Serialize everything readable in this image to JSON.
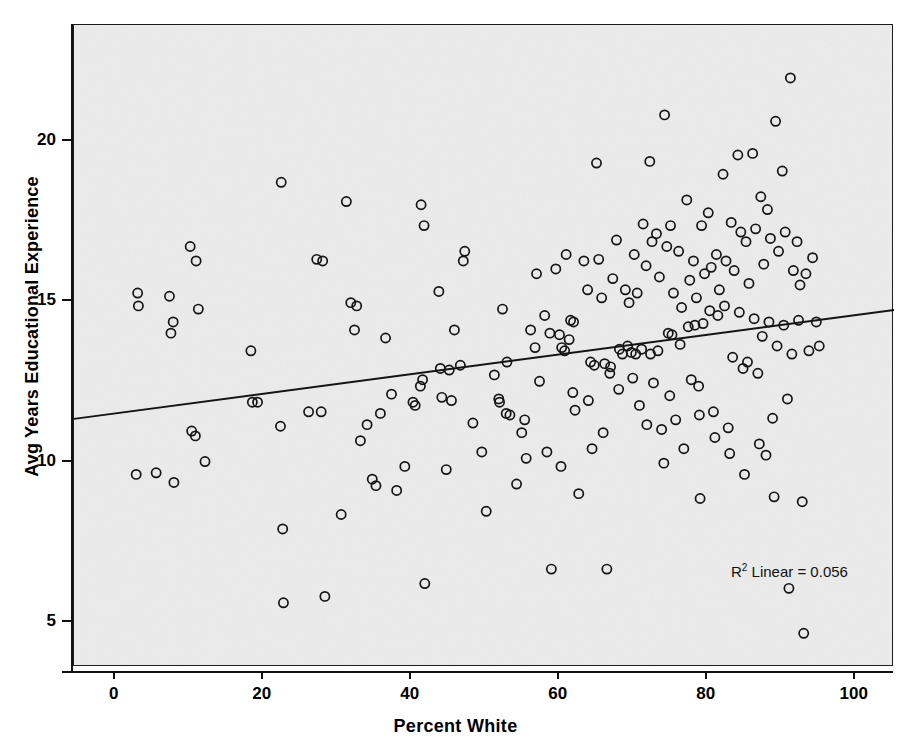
{
  "chart_data": {
    "type": "scatter",
    "title": "",
    "xlabel": "Percent White",
    "ylabel": "Avg Years Educational Experience",
    "xlim": [
      -5.5,
      105.3
    ],
    "ylim": [
      3.6,
      23.6
    ],
    "xticks": [
      0,
      20,
      40,
      60,
      80,
      100
    ],
    "yticks": [
      5,
      10,
      15,
      20
    ],
    "grid": false,
    "legend": null,
    "annotation": "R² Linear = 0.056",
    "annotation_r2_prefix": "R",
    "annotation_r2_exp": "2",
    "annotation_r2_text": " Linear = 0.056",
    "marker_style": "open-circle",
    "fit_line": {
      "type": "linear",
      "r_squared": 0.056,
      "x_start": -5.5,
      "y_start": 11.33,
      "x_end": 105.3,
      "y_end": 14.72
    },
    "points": [
      [
        3.1,
        15.25
      ],
      [
        3.2,
        14.85
      ],
      [
        2.9,
        9.6
      ],
      [
        5.6,
        9.65
      ],
      [
        7.4,
        15.15
      ],
      [
        7.9,
        14.35
      ],
      [
        7.6,
        14.0
      ],
      [
        8.0,
        9.35
      ],
      [
        10.2,
        16.7
      ],
      [
        11.0,
        16.25
      ],
      [
        11.3,
        14.75
      ],
      [
        10.4,
        10.95
      ],
      [
        10.9,
        10.8
      ],
      [
        12.2,
        10.0
      ],
      [
        18.4,
        13.45
      ],
      [
        18.6,
        11.85
      ],
      [
        19.3,
        11.85
      ],
      [
        22.5,
        18.7
      ],
      [
        22.4,
        11.1
      ],
      [
        22.7,
        7.9
      ],
      [
        22.8,
        5.6
      ],
      [
        26.2,
        11.55
      ],
      [
        27.3,
        16.3
      ],
      [
        28.1,
        16.25
      ],
      [
        27.9,
        11.55
      ],
      [
        28.4,
        5.8
      ],
      [
        30.6,
        8.35
      ],
      [
        31.3,
        18.1
      ],
      [
        31.9,
        14.95
      ],
      [
        32.7,
        14.85
      ],
      [
        32.4,
        14.1
      ],
      [
        33.2,
        10.65
      ],
      [
        34.1,
        11.15
      ],
      [
        34.8,
        9.45
      ],
      [
        35.3,
        9.25
      ],
      [
        35.9,
        11.5
      ],
      [
        36.6,
        13.85
      ],
      [
        37.4,
        12.1
      ],
      [
        38.1,
        9.1
      ],
      [
        39.2,
        9.85
      ],
      [
        40.3,
        11.85
      ],
      [
        40.6,
        11.75
      ],
      [
        41.4,
        18.0
      ],
      [
        41.8,
        17.35
      ],
      [
        41.6,
        12.55
      ],
      [
        41.3,
        12.35
      ],
      [
        41.9,
        6.2
      ],
      [
        43.8,
        15.3
      ],
      [
        44.2,
        12.0
      ],
      [
        44.8,
        9.75
      ],
      [
        45.5,
        11.9
      ],
      [
        45.9,
        14.1
      ],
      [
        46.7,
        13.0
      ],
      [
        47.3,
        16.55
      ],
      [
        47.1,
        16.25
      ],
      [
        48.4,
        11.2
      ],
      [
        49.6,
        10.3
      ],
      [
        50.2,
        8.45
      ],
      [
        51.3,
        12.7
      ],
      [
        51.9,
        11.95
      ],
      [
        52.0,
        11.85
      ],
      [
        52.4,
        14.75
      ],
      [
        52.9,
        11.5
      ],
      [
        53.4,
        11.45
      ],
      [
        54.3,
        9.3
      ],
      [
        55.0,
        10.9
      ],
      [
        55.6,
        10.1
      ],
      [
        56.2,
        14.1
      ],
      [
        56.8,
        13.55
      ],
      [
        57.4,
        12.5
      ],
      [
        58.1,
        14.55
      ],
      [
        58.8,
        14.0
      ],
      [
        58.4,
        10.3
      ],
      [
        59.0,
        6.65
      ],
      [
        59.6,
        16.0
      ],
      [
        60.1,
        13.95
      ],
      [
        60.4,
        13.55
      ],
      [
        60.8,
        13.45
      ],
      [
        60.3,
        9.85
      ],
      [
        61.0,
        16.45
      ],
      [
        61.6,
        14.4
      ],
      [
        61.4,
        13.8
      ],
      [
        61.9,
        12.15
      ],
      [
        62.2,
        11.6
      ],
      [
        62.7,
        9.0
      ],
      [
        63.4,
        16.25
      ],
      [
        63.9,
        15.35
      ],
      [
        64.3,
        13.1
      ],
      [
        64.8,
        13.0
      ],
      [
        64.5,
        10.4
      ],
      [
        65.1,
        19.3
      ],
      [
        65.4,
        16.3
      ],
      [
        65.8,
        15.1
      ],
      [
        66.2,
        13.05
      ],
      [
        66.9,
        12.75
      ],
      [
        66.5,
        6.65
      ],
      [
        67.3,
        15.7
      ],
      [
        67.8,
        16.9
      ],
      [
        68.2,
        13.5
      ],
      [
        68.6,
        13.35
      ],
      [
        68.1,
        12.25
      ],
      [
        69.0,
        15.35
      ],
      [
        69.5,
        14.95
      ],
      [
        69.3,
        13.6
      ],
      [
        69.8,
        13.4
      ],
      [
        70.2,
        16.45
      ],
      [
        70.6,
        15.25
      ],
      [
        70.4,
        13.35
      ],
      [
        70.9,
        11.75
      ],
      [
        71.4,
        17.4
      ],
      [
        71.8,
        16.1
      ],
      [
        71.2,
        13.5
      ],
      [
        71.9,
        11.15
      ],
      [
        72.3,
        19.35
      ],
      [
        72.6,
        16.85
      ],
      [
        72.4,
        13.35
      ],
      [
        72.8,
        12.45
      ],
      [
        73.2,
        17.1
      ],
      [
        73.6,
        15.75
      ],
      [
        73.4,
        13.45
      ],
      [
        73.9,
        11.0
      ],
      [
        74.3,
        20.8
      ],
      [
        74.6,
        16.7
      ],
      [
        74.8,
        14.0
      ],
      [
        74.2,
        9.95
      ],
      [
        75.1,
        17.35
      ],
      [
        75.5,
        15.25
      ],
      [
        75.3,
        13.95
      ],
      [
        75.8,
        11.3
      ],
      [
        76.2,
        16.55
      ],
      [
        76.6,
        14.8
      ],
      [
        76.4,
        13.65
      ],
      [
        76.9,
        10.4
      ],
      [
        77.3,
        18.15
      ],
      [
        77.7,
        15.65
      ],
      [
        77.5,
        14.2
      ],
      [
        77.9,
        12.55
      ],
      [
        78.2,
        16.25
      ],
      [
        78.6,
        15.1
      ],
      [
        78.4,
        14.25
      ],
      [
        78.9,
        12.35
      ],
      [
        79.3,
        17.35
      ],
      [
        79.7,
        15.85
      ],
      [
        79.5,
        14.3
      ],
      [
        79.1,
        8.85
      ],
      [
        80.2,
        17.75
      ],
      [
        80.6,
        16.05
      ],
      [
        80.4,
        14.7
      ],
      [
        80.9,
        11.55
      ],
      [
        81.3,
        16.45
      ],
      [
        81.7,
        15.35
      ],
      [
        81.5,
        14.55
      ],
      [
        81.1,
        10.75
      ],
      [
        82.2,
        18.95
      ],
      [
        82.6,
        16.25
      ],
      [
        82.4,
        14.85
      ],
      [
        82.9,
        11.05
      ],
      [
        83.3,
        17.45
      ],
      [
        83.7,
        15.95
      ],
      [
        83.5,
        13.25
      ],
      [
        83.1,
        10.25
      ],
      [
        84.2,
        19.55
      ],
      [
        84.6,
        17.15
      ],
      [
        84.4,
        14.65
      ],
      [
        84.9,
        12.9
      ],
      [
        85.3,
        16.85
      ],
      [
        85.7,
        15.55
      ],
      [
        85.5,
        13.1
      ],
      [
        85.1,
        9.6
      ],
      [
        86.2,
        19.6
      ],
      [
        86.6,
        17.25
      ],
      [
        86.4,
        14.45
      ],
      [
        86.9,
        12.75
      ],
      [
        87.3,
        18.25
      ],
      [
        87.7,
        16.15
      ],
      [
        87.5,
        13.9
      ],
      [
        87.1,
        10.55
      ],
      [
        88.2,
        17.85
      ],
      [
        88.6,
        16.95
      ],
      [
        88.4,
        14.35
      ],
      [
        88.9,
        11.35
      ],
      [
        89.3,
        20.6
      ],
      [
        89.7,
        16.55
      ],
      [
        89.5,
        13.6
      ],
      [
        89.1,
        8.9
      ],
      [
        90.2,
        19.05
      ],
      [
        90.6,
        17.15
      ],
      [
        90.4,
        14.25
      ],
      [
        90.9,
        11.95
      ],
      [
        91.3,
        21.95
      ],
      [
        91.7,
        15.95
      ],
      [
        91.5,
        13.35
      ],
      [
        91.1,
        6.05
      ],
      [
        92.2,
        16.85
      ],
      [
        92.6,
        15.5
      ],
      [
        92.4,
        14.4
      ],
      [
        92.9,
        8.75
      ],
      [
        93.1,
        4.65
      ],
      [
        93.4,
        15.85
      ],
      [
        93.8,
        13.45
      ],
      [
        94.3,
        16.35
      ],
      [
        94.8,
        14.35
      ],
      [
        95.2,
        13.6
      ],
      [
        88.0,
        10.2
      ],
      [
        67.0,
        12.95
      ],
      [
        64.0,
        11.9
      ],
      [
        62.0,
        14.35
      ],
      [
        57.0,
        15.85
      ],
      [
        55.4,
        11.3
      ],
      [
        53.0,
        13.1
      ],
      [
        45.2,
        12.85
      ],
      [
        44.0,
        12.9
      ],
      [
        66.0,
        10.9
      ],
      [
        70.0,
        12.6
      ],
      [
        75.0,
        12.05
      ],
      [
        79.0,
        11.45
      ]
    ]
  },
  "axes": {
    "x_tick_labels": [
      "0",
      "20",
      "40",
      "60",
      "80",
      "100"
    ],
    "y_tick_labels": [
      "5",
      "10",
      "15",
      "20"
    ]
  }
}
